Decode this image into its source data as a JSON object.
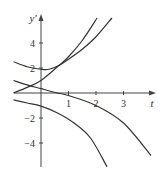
{
  "chart_data": {
    "type": "line",
    "title": "",
    "xlabel": "t",
    "ylabel": "y'",
    "xlim": [
      -1,
      4.2
    ],
    "ylim": [
      -5.9,
      6
    ],
    "grid": false,
    "legend": null,
    "x_ticks": [
      1,
      2,
      3
    ],
    "x_tick_labels": [
      "1",
      "2",
      "3"
    ],
    "y_ticks": [
      4,
      2,
      -2,
      -4
    ],
    "y_tick_labels": [
      "4",
      "2",
      "−2",
      "−4"
    ],
    "series": [
      {
        "name": "curve-a-u-shape",
        "x": [
          -1,
          -0.5,
          0,
          0.3,
          0.65,
          1.0,
          1.5,
          2.0,
          2.58
        ],
        "y": [
          2.5,
          2.1,
          1.9,
          1.9,
          2.2,
          2.7,
          3.5,
          4.5,
          6.0
        ]
      },
      {
        "name": "curve-b-rising",
        "x": [
          -1,
          -0.5,
          0,
          0.65,
          1.0,
          1.5,
          2.04
        ],
        "y": [
          0.0,
          0.45,
          1.0,
          2.2,
          2.9,
          4.2,
          6.0
        ]
      },
      {
        "name": "curve-c-falling",
        "x": [
          -1,
          -0.5,
          0,
          0.6,
          1.0,
          2.0,
          3.0,
          4.0
        ],
        "y": [
          1.0,
          0.65,
          0.35,
          0.0,
          -0.2,
          -1.0,
          -2.4,
          -5.0
        ]
      },
      {
        "name": "curve-d-falling",
        "x": [
          -1,
          -0.5,
          0,
          0.6,
          1.2,
          1.8,
          2.4
        ],
        "y": [
          -0.55,
          -0.8,
          -1.05,
          -1.6,
          -2.4,
          -3.6,
          -5.9
        ]
      }
    ]
  },
  "axes": {
    "x_label": "t",
    "y_label": "y'",
    "x_tick_labels": [
      "1",
      "2",
      "3"
    ],
    "y_tick_labels": [
      "4",
      "2",
      "−2",
      "−4"
    ]
  },
  "colors": {
    "curve": "#333333",
    "axis": "#444444"
  }
}
